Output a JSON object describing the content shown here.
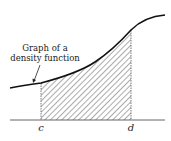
{
  "figure": {
    "annotation_line1": "Graph of a",
    "annotation_line2": "density function",
    "lower_bound_label": "c",
    "upper_bound_label": "d",
    "colors": {
      "curve": "#111111",
      "axis": "#555555",
      "hatch": "#444444",
      "background": "#ffffff"
    }
  }
}
